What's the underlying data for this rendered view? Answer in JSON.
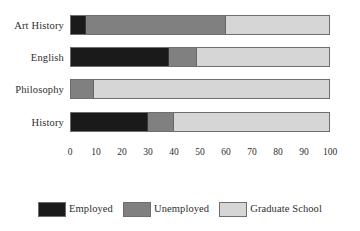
{
  "chart_data": {
    "type": "bar",
    "orientation": "horizontal",
    "stacked": true,
    "normalized_percent": true,
    "title": "",
    "subtitle": "",
    "xlabel": "",
    "ylabel": "",
    "xlim": [
      0,
      100
    ],
    "ylim": null,
    "grid": false,
    "legend_position": "bottom",
    "categories": [
      "Art History",
      "English",
      "Philosophy",
      "History"
    ],
    "tick_labels": [
      "0",
      "10",
      "20",
      "30",
      "40",
      "50",
      "60",
      "70",
      "80",
      "90",
      "100"
    ],
    "tick_values": [
      0,
      10,
      20,
      30,
      40,
      50,
      60,
      70,
      80,
      90,
      100
    ],
    "series": [
      {
        "name": "Employed",
        "color": "#1a1a1a",
        "values": [
          6,
          38,
          0,
          30
        ]
      },
      {
        "name": "Unemployed",
        "color": "#808080",
        "values": [
          54,
          11,
          9,
          10
        ]
      },
      {
        "name": "Graduate School",
        "color": "#d6d6d6",
        "values": [
          40,
          51,
          91,
          60
        ]
      }
    ],
    "annotations": []
  },
  "axis": {
    "categories": [
      {
        "label": "Art History"
      },
      {
        "label": "English"
      },
      {
        "label": "Philosophy"
      },
      {
        "label": "History"
      }
    ],
    "ticks": [
      {
        "label": "0",
        "value": 0
      },
      {
        "label": "10",
        "value": 10
      },
      {
        "label": "20",
        "value": 20
      },
      {
        "label": "30",
        "value": 30
      },
      {
        "label": "40",
        "value": 40
      },
      {
        "label": "50",
        "value": 50
      },
      {
        "label": "60",
        "value": 60
      },
      {
        "label": "70",
        "value": 70
      },
      {
        "label": "80",
        "value": 80
      },
      {
        "label": "90",
        "value": 90
      },
      {
        "label": "100",
        "value": 100
      }
    ]
  },
  "legend": {
    "items": [
      {
        "label": "Employed",
        "color": "#1a1a1a"
      },
      {
        "label": "Unemployed",
        "color": "#808080"
      },
      {
        "label": "Graduate School",
        "color": "#d6d6d6"
      }
    ]
  },
  "layout": {
    "plot_left": 70,
    "plot_right": 330,
    "bar_height": 20,
    "bar_tops": [
      15,
      47,
      79,
      112
    ]
  }
}
